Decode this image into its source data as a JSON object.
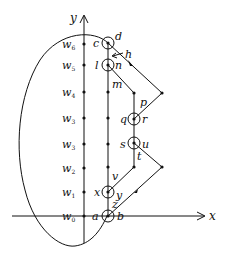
{
  "axes": {
    "x_label": "x",
    "y_label": "y"
  },
  "w_labels": [
    {
      "name": "w",
      "sub": "6",
      "y": 44
    },
    {
      "name": "w",
      "sub": "5",
      "y": 65
    },
    {
      "name": "w",
      "sub": "4",
      "y": 92
    },
    {
      "name": "w",
      "sub": "3",
      "y": 118
    },
    {
      "name": "w",
      "sub": "3",
      "y": 144
    },
    {
      "name": "w",
      "sub": "2",
      "y": 168
    },
    {
      "name": "w",
      "sub": "1",
      "y": 192
    },
    {
      "name": "w",
      "sub": "0",
      "y": 216
    }
  ],
  "points": {
    "c": "c",
    "d": "d",
    "h": "h",
    "l": "l",
    "n": "n",
    "m": "m",
    "p": "p",
    "q": "q",
    "r": "r",
    "s": "s",
    "u": "u",
    "t": "t",
    "v": "v",
    "x": "x",
    "y": "y",
    "z": "z",
    "a": "a",
    "b": "b"
  },
  "colors": {
    "ink": "#111111",
    "background": "#ffffff"
  }
}
